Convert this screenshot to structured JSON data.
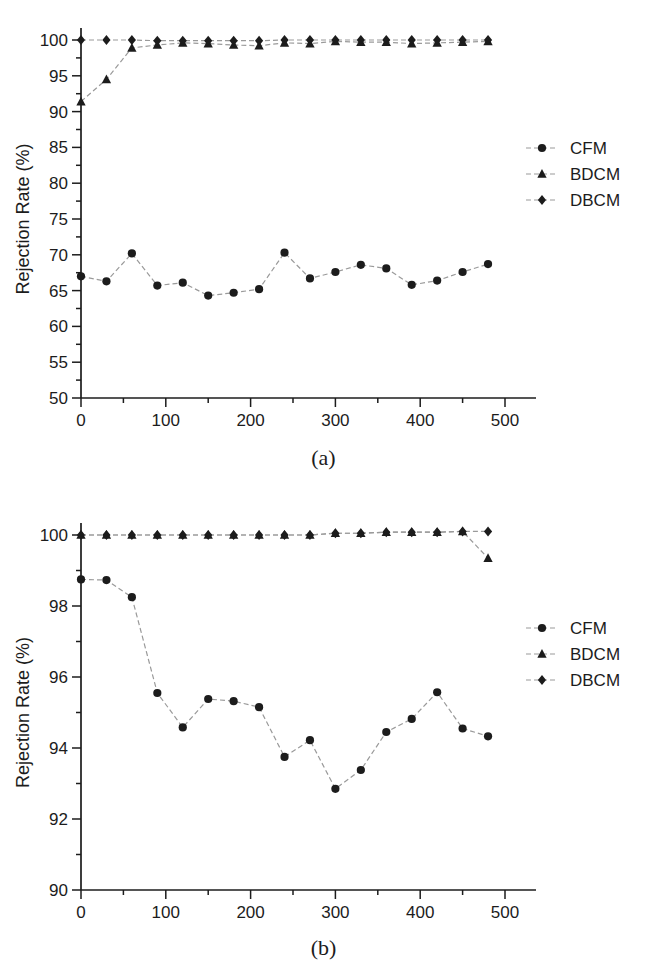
{
  "figure": {
    "panels": [
      {
        "id": "a",
        "caption": "(a)",
        "xlabel": "Time (min)",
        "ylabel": "Rejection Rate (%)",
        "xticks": [
          "0",
          "100",
          "200",
          "300",
          "400",
          "500"
        ],
        "yticks": [
          "50",
          "55",
          "60",
          "65",
          "70",
          "75",
          "80",
          "85",
          "90",
          "95",
          "100"
        ],
        "legend": [
          {
            "label": "CFM",
            "marker": "circle"
          },
          {
            "label": "BDCM",
            "marker": "triangle"
          },
          {
            "label": "DBCM",
            "marker": "diamond"
          }
        ]
      },
      {
        "id": "b",
        "caption": "(b)",
        "xlabel": "Time (min)",
        "ylabel": "Rejection Rate (%)",
        "xticks": [
          "0",
          "100",
          "200",
          "300",
          "400",
          "500"
        ],
        "yticks": [
          "90",
          "92",
          "94",
          "96",
          "98",
          "100"
        ],
        "legend": [
          {
            "label": "CFM",
            "marker": "circle"
          },
          {
            "label": "BDCM",
            "marker": "triangle"
          },
          {
            "label": "DBCM",
            "marker": "diamond"
          }
        ]
      }
    ]
  },
  "chart_data": [
    {
      "type": "line",
      "panel": "a",
      "title": "",
      "xlabel": "Time (min)",
      "ylabel": "Rejection Rate (%)",
      "xlim": [
        0,
        500
      ],
      "ylim": [
        50,
        100
      ],
      "xtick_step": 100,
      "ytick_step": 5,
      "xminor_step": 50,
      "yminor_step": 2.5,
      "grid": false,
      "legend_position": "right",
      "x": [
        0,
        30,
        60,
        90,
        120,
        150,
        180,
        210,
        240,
        270,
        300,
        330,
        360,
        390,
        420,
        450,
        480
      ],
      "series": [
        {
          "name": "CFM",
          "marker": "circle",
          "values": [
            67.0,
            66.3,
            70.2,
            65.7,
            66.1,
            64.3,
            64.7,
            65.2,
            70.3,
            66.7,
            67.6,
            68.6,
            68.1,
            65.8,
            66.4,
            67.6,
            68.7
          ]
        },
        {
          "name": "BDCM",
          "marker": "triangle",
          "values": [
            91.4,
            94.5,
            98.9,
            99.3,
            99.6,
            99.5,
            99.3,
            99.2,
            99.6,
            99.5,
            99.8,
            99.7,
            99.7,
            99.5,
            99.6,
            99.7,
            99.8
          ]
        },
        {
          "name": "DBCM",
          "marker": "diamond",
          "values": [
            100.0,
            100.0,
            100.0,
            99.9,
            99.9,
            99.9,
            99.9,
            99.9,
            100.0,
            100.0,
            100.0,
            100.0,
            100.0,
            100.0,
            100.0,
            100.0,
            100.0
          ]
        }
      ]
    },
    {
      "type": "line",
      "panel": "b",
      "title": "",
      "xlabel": "Time (min)",
      "ylabel": "Rejection Rate (%)",
      "xlim": [
        0,
        500
      ],
      "ylim": [
        90,
        100
      ],
      "xtick_step": 100,
      "ytick_step": 2,
      "xminor_step": 50,
      "yminor_step": 1,
      "grid": false,
      "legend_position": "right",
      "x": [
        0,
        30,
        60,
        90,
        120,
        150,
        180,
        210,
        240,
        270,
        300,
        330,
        360,
        390,
        420,
        450,
        480
      ],
      "series": [
        {
          "name": "CFM",
          "marker": "circle",
          "values": [
            98.75,
            98.73,
            98.25,
            95.55,
            94.58,
            95.38,
            95.32,
            95.15,
            93.75,
            94.22,
            92.85,
            93.38,
            94.45,
            94.82,
            95.57,
            94.55,
            94.33
          ]
        },
        {
          "name": "BDCM",
          "marker": "triangle",
          "values": [
            100.0,
            100.0,
            100.0,
            100.0,
            100.0,
            100.0,
            100.0,
            100.0,
            100.0,
            100.0,
            100.05,
            100.05,
            100.08,
            100.08,
            100.08,
            100.1,
            99.35
          ]
        },
        {
          "name": "DBCM",
          "marker": "diamond",
          "values": [
            100.0,
            100.0,
            100.0,
            100.0,
            100.0,
            100.0,
            100.0,
            100.0,
            100.0,
            100.0,
            100.05,
            100.05,
            100.08,
            100.08,
            100.08,
            100.1,
            100.1
          ]
        }
      ]
    }
  ]
}
